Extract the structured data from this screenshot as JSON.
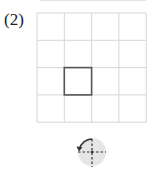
{
  "problem": {
    "label": "(2)"
  },
  "grid": {
    "rows": 4,
    "cols": 4,
    "origin_x": 37,
    "origin_y": 13,
    "cell_size": 27.3,
    "line_color": "#d6d6d6",
    "highlighted_cell": {
      "row": 2,
      "col": 1,
      "stroke_color": "#555555"
    }
  },
  "rotation_icon": {
    "name": "rotate-90-counterclockwise-icon",
    "direction": "counterclockwise",
    "angle_deg": 90,
    "circle_fill": "#e6e6e6",
    "line_color": "#333333"
  }
}
